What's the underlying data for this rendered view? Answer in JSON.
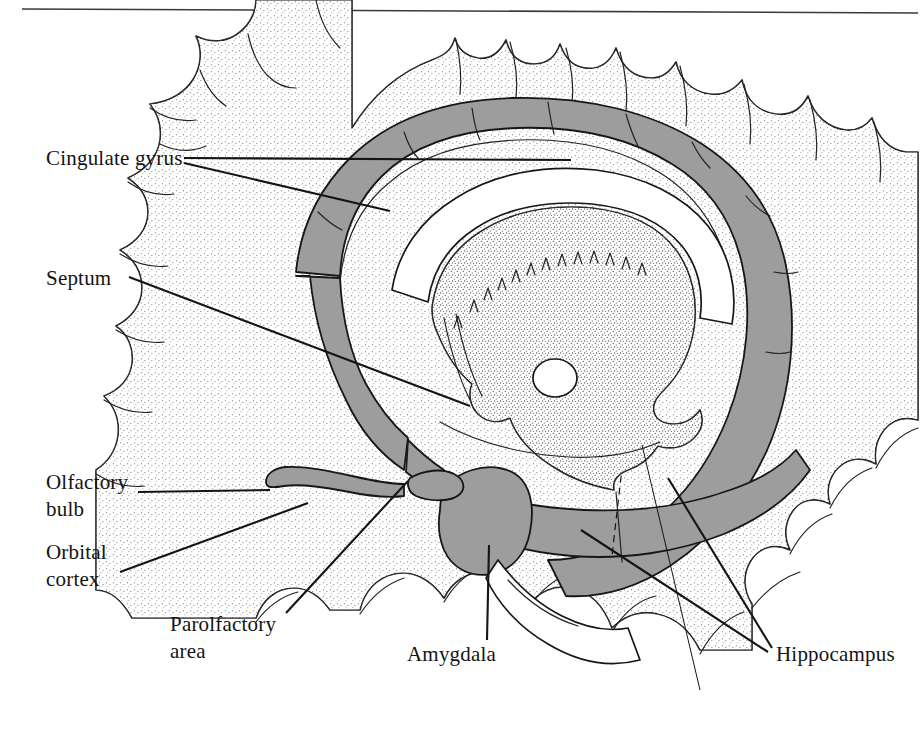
{
  "figure": {
    "kind": "anatomical-illustration",
    "background_color": "#ffffff",
    "ink_color": "#141414",
    "shaded_structure_color": "#9d9d9d",
    "stipple_color": "#555555",
    "top_rule": {
      "present": true,
      "color": "#3a3a3a"
    }
  },
  "labels": [
    {
      "id": "cingulate-gyrus",
      "text": "Cingulate gyrus",
      "lines": [
        "Cingulate gyrus"
      ],
      "x": 46,
      "y": 165,
      "anchor": "start",
      "leader_count": 2
    },
    {
      "id": "septum",
      "text": "Septum",
      "lines": [
        "Septum"
      ],
      "x": 46,
      "y": 285,
      "anchor": "start",
      "leader_count": 1
    },
    {
      "id": "olfactory-bulb",
      "text": "Olfactory bulb",
      "lines": [
        "Olfactory",
        "bulb"
      ],
      "x": 46,
      "y": 489,
      "anchor": "start",
      "leader_count": 1
    },
    {
      "id": "orbital-cortex",
      "text": "Orbital cortex",
      "lines": [
        "Orbital",
        "cortex"
      ],
      "x": 46,
      "y": 559,
      "anchor": "start",
      "leader_count": 1
    },
    {
      "id": "parolfactory-area",
      "text": "Parolfactory area",
      "lines": [
        "Parolfactory",
        "area"
      ],
      "x": 170,
      "y": 631,
      "anchor": "start",
      "leader_count": 1
    },
    {
      "id": "amygdala",
      "text": "Amygdala",
      "lines": [
        "Amygdala"
      ],
      "x": 407,
      "y": 661,
      "anchor": "start",
      "leader_count": 1
    },
    {
      "id": "hippocampus",
      "text": "Hippocampus",
      "lines": [
        "Hippocampus"
      ],
      "x": 776,
      "y": 661,
      "anchor": "start",
      "leader_count": 2
    }
  ],
  "structures": [
    {
      "id": "cingulate-gyrus-band",
      "name": "cingulate gyrus",
      "shading": "gray"
    },
    {
      "id": "hippocampal-band",
      "name": "hippocampus / parahippocampal band",
      "shading": "gray"
    },
    {
      "id": "amygdala-body",
      "name": "amygdala",
      "shading": "gray"
    },
    {
      "id": "olfactory-bulb-body",
      "name": "olfactory bulb",
      "shading": "gray"
    },
    {
      "id": "septal-area",
      "name": "septum",
      "shading": "gray"
    },
    {
      "id": "thalamus-brainstem",
      "name": "thalamus and brainstem",
      "shading": "stipple"
    },
    {
      "id": "corpus-callosum",
      "name": "corpus callosum",
      "shading": "white"
    },
    {
      "id": "massa-intermedia",
      "name": "massa intermedia",
      "shading": "white"
    },
    {
      "id": "cerebral-cortex",
      "name": "cerebral cortex gyri",
      "shading": "stipple-edge"
    }
  ]
}
